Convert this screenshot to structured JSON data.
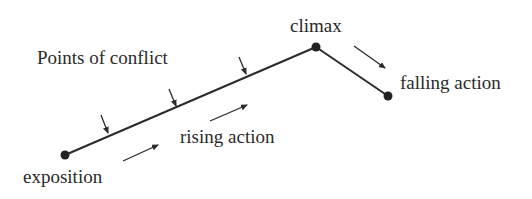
{
  "diagram": {
    "labels": {
      "points_of_conflict": "Points of conflict",
      "climax": "climax",
      "falling_action": "falling action",
      "rising_action": "rising action",
      "exposition": "exposition"
    },
    "nodes": [
      {
        "id": "exposition",
        "x": 65,
        "y": 155
      },
      {
        "id": "climax",
        "x": 316,
        "y": 47
      },
      {
        "id": "falling_end",
        "x": 388,
        "y": 96
      }
    ],
    "conflict_arrows": 3,
    "colors": {
      "line": "#2b2b2b",
      "text": "#2a2a2a",
      "background": "#ffffff"
    }
  }
}
